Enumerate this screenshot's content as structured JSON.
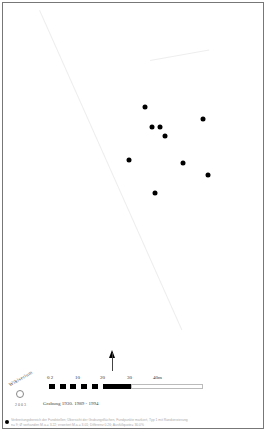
{
  "map": {
    "type": "distribution-map",
    "marker_color": "#000000",
    "points": [
      {
        "x": 145,
        "y": 107
      },
      {
        "x": 152,
        "y": 127
      },
      {
        "x": 160,
        "y": 127
      },
      {
        "x": 165,
        "y": 136
      },
      {
        "x": 203,
        "y": 119
      },
      {
        "x": 129,
        "y": 160
      },
      {
        "x": 183,
        "y": 163
      },
      {
        "x": 208,
        "y": 175
      },
      {
        "x": 155,
        "y": 193
      }
    ]
  },
  "north_arrow": {
    "icon": "north-arrow-icon"
  },
  "scale": {
    "labels": [
      "0 2",
      "10",
      "20",
      "30",
      "40m"
    ]
  },
  "logo": {
    "text": "Wikiserium",
    "year": "2003"
  },
  "survey_text": "Grabung 1930. 1989 - 1994",
  "legend": {
    "caption_line1": "Verbreitungsbereich der Fundstellen; Übersicht der Grabungsflächen, Fundpunkte markiert, Typ 1 mit Randverzierung",
    "caption_line2": "n= 9; Ø vorhanden M.a.= 3.22; erweitert M.a.= 3.01; Differenz 0.26; Ausfüllquote= 30.0%"
  }
}
